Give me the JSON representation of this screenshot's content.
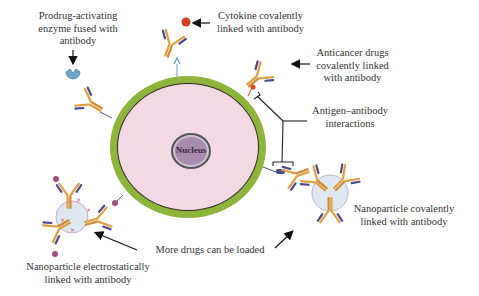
{
  "diagram": {
    "type": "antibody-conjugate strategies around a target cell",
    "cell": {
      "nucleus_label": "Nucleus",
      "membrane_color": "#8db53c",
      "cytoplasm_color": "#f3d9e4",
      "nucleus_color": "#a98ab0"
    },
    "labels": {
      "prodrug": [
        "Prodrug-activating",
        "enzyme fused with",
        "antibody"
      ],
      "cytokine": [
        "Cytokine covalently",
        "linked with antibody"
      ],
      "anticancer": [
        "Anticancer drugs",
        "covalently linked",
        "with antibody"
      ],
      "antigen": [
        "Antigen–antibody",
        "interactions"
      ],
      "nano_covalent": [
        "Nanoparticle covalently",
        "linked with antibody"
      ],
      "more_drugs": [
        "More drugs can be loaded"
      ],
      "nano_electro": [
        "Nanoparticle electrostatically",
        "linked with antibody"
      ]
    },
    "colors": {
      "antibody_heavy": "#e0a040",
      "antibody_light": "#4a4a90",
      "enzyme": "#6aa6c8",
      "cytokine": "#d04020",
      "drug": "#e04020",
      "nanoparticle": "#dfe8f2",
      "arrow": "#111111"
    }
  }
}
